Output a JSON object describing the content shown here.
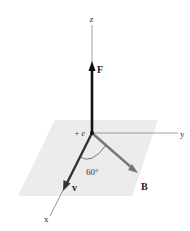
{
  "diagram": {
    "axes": {
      "x": {
        "label": "x"
      },
      "y": {
        "label": "y"
      },
      "z": {
        "label": "z"
      }
    },
    "charge": {
      "label": "+ e"
    },
    "vectors": {
      "force": {
        "label": "F",
        "direction": "+z",
        "color": "#111111"
      },
      "velocity": {
        "label": "v",
        "direction": "+x",
        "color": "#333333"
      },
      "field": {
        "label": "B",
        "direction": "in xy-plane",
        "color": "#777777"
      }
    },
    "angle": {
      "label": "60°",
      "between": [
        "v",
        "B"
      ]
    },
    "plane": {
      "color": "#ececec"
    }
  }
}
